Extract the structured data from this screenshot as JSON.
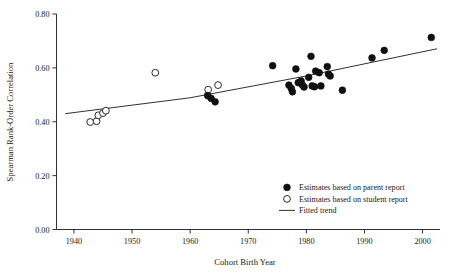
{
  "chart_data": {
    "type": "scatter",
    "title": "",
    "xlabel": "Cohort Birth Year",
    "ylabel": "Spearman Rank-Order Correlation",
    "xlim": [
      1937,
      2003
    ],
    "ylim": [
      0.0,
      0.8
    ],
    "xticks": [
      1940,
      1950,
      1960,
      1970,
      1980,
      1990,
      2000
    ],
    "xtick_labels": [
      "1940",
      "1950",
      "1960",
      "1970",
      "1980",
      "1990",
      "2000"
    ],
    "yticks": [
      0.0,
      0.2,
      0.4,
      0.6,
      0.8
    ],
    "ytick_labels": [
      "0.00",
      "0.20",
      "0.40",
      "0.60",
      "0.80"
    ],
    "grid": false,
    "legend_position": "lower-right",
    "series": [
      {
        "name": "Estimates based on parent report",
        "marker": "filled-circle",
        "color": "#101010",
        "points": [
          [
            1963.0,
            0.497
          ],
          [
            1963.6,
            0.487
          ],
          [
            1964.3,
            0.474
          ],
          [
            1974.2,
            0.608
          ],
          [
            1977.0,
            0.536
          ],
          [
            1977.4,
            0.524
          ],
          [
            1977.6,
            0.511
          ],
          [
            1978.2,
            0.596
          ],
          [
            1978.6,
            0.545
          ],
          [
            1979.1,
            0.552
          ],
          [
            1979.3,
            0.537
          ],
          [
            1979.6,
            0.529
          ],
          [
            1980.4,
            0.565
          ],
          [
            1980.8,
            0.643
          ],
          [
            1981.0,
            0.533
          ],
          [
            1981.4,
            0.53
          ],
          [
            1981.6,
            0.588
          ],
          [
            1982.2,
            0.582
          ],
          [
            1982.5,
            0.533
          ],
          [
            1983.6,
            0.605
          ],
          [
            1983.8,
            0.577
          ],
          [
            1984.1,
            0.57
          ],
          [
            1986.2,
            0.517
          ],
          [
            1991.3,
            0.637
          ],
          [
            1993.4,
            0.665
          ],
          [
            2001.5,
            0.713
          ]
        ]
      },
      {
        "name": "Estimates based on student report",
        "marker": "open-circle",
        "color": "#ffffff",
        "points": [
          [
            1942.8,
            0.399
          ],
          [
            1943.9,
            0.402
          ],
          [
            1944.2,
            0.424
          ],
          [
            1945.0,
            0.432
          ],
          [
            1945.5,
            0.441
          ],
          [
            1954.0,
            0.582
          ],
          [
            1963.1,
            0.519
          ],
          [
            1964.8,
            0.536
          ]
        ]
      }
    ],
    "trend": {
      "name": "Fitted trend",
      "style": "line",
      "color": "#1a1a1a",
      "points": [
        [
          1938.5,
          0.43
        ],
        [
          1960.0,
          0.489
        ],
        [
          1980.0,
          0.57
        ],
        [
          2002.5,
          0.671
        ]
      ]
    }
  },
  "legend": {
    "items": [
      {
        "label": "Estimates based on parent report",
        "marker": "filled-circle"
      },
      {
        "label": "Estimates based on student report",
        "marker": "open-circle"
      },
      {
        "label": "Fitted trend",
        "marker": "line"
      }
    ]
  },
  "axes": {
    "x_title": "Cohort Birth Year",
    "y_title": "Spearman Rank-Order Correlation"
  }
}
